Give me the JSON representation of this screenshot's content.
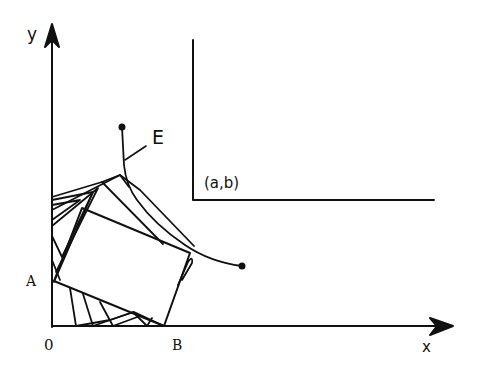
{
  "figure": {
    "type": "geometric diagram",
    "stroke_color": "#111111",
    "background_color": "#ffffff"
  },
  "labels": {
    "y_axis": "y",
    "x_axis": "x",
    "origin": "0",
    "point_a": "A",
    "point_b": "B",
    "curve": "E",
    "corner": "(a,b)"
  },
  "geometry": {
    "axes": {
      "origin_px": [
        52,
        326
      ],
      "y_axis_top_px": [
        52,
        27
      ],
      "x_axis_right_px": [
        440,
        326
      ]
    },
    "corner_wall": {
      "vertical_top_px": [
        193,
        40
      ],
      "corner_px": [
        193,
        200
      ],
      "horizontal_end_px": [
        434,
        200
      ]
    },
    "main_rectangle_px": [
      [
        82,
        208
      ],
      [
        190,
        253
      ],
      [
        164,
        326
      ],
      [
        54,
        281
      ]
    ],
    "envelope_curve_E": {
      "start_dot_px": [
        122,
        127
      ],
      "end_dot_px": [
        242,
        266
      ]
    }
  }
}
